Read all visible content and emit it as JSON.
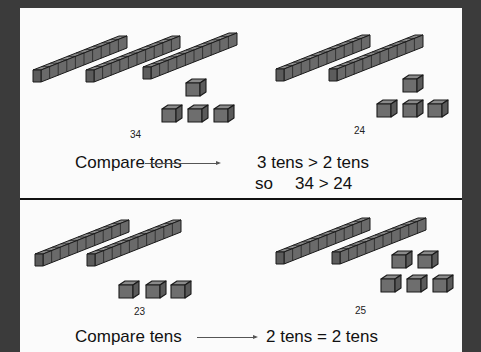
{
  "colors": {
    "frame": "#3b3b3b",
    "panel": "#fbfbfb",
    "block_front": "#6e6e6e",
    "block_top": "#8a8a8a",
    "block_side": "#5a5a5a",
    "outline": "#1a1a1a"
  },
  "top_example": {
    "left_number": {
      "label": "34",
      "tens": 3,
      "ones": 4
    },
    "right_number": {
      "label": "24",
      "tens": 2,
      "ones": 4
    },
    "compare_label": "Compare tens",
    "result": "3 tens > 2 tens",
    "conclusion_prefix": "so",
    "conclusion": "34 > 24"
  },
  "bottom_example": {
    "left_number": {
      "label": "23",
      "tens": 2,
      "ones": 3
    },
    "right_number": {
      "label": "25",
      "tens": 2,
      "ones": 5
    },
    "compare_label": "Compare tens",
    "result": "2 tens = 2 tens"
  }
}
